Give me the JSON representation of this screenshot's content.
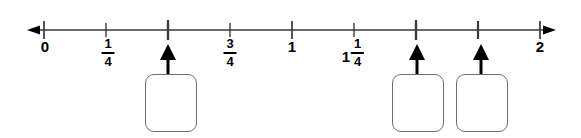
{
  "figure": {
    "kind": "number-line-diagram",
    "title": "",
    "axis": {
      "start_value": 0,
      "end_value": 2,
      "step": 0.25,
      "left_arrowhead": true,
      "right_arrowhead": true,
      "line_color": "#3a3a3a",
      "line_y": 30,
      "x_start_px": 44,
      "x_end_px": 540,
      "arrow_tip_left_px": 27,
      "arrow_tip_right_px": 556
    },
    "ticks": [
      {
        "value": 0,
        "x": 44,
        "major": true,
        "label": "0",
        "label_type": "integer"
      },
      {
        "value": 0.25,
        "x": 106,
        "major": false,
        "label": "1/4",
        "label_type": "fraction",
        "numerator": "1",
        "denominator": "4"
      },
      {
        "value": 0.5,
        "x": 168,
        "major": true,
        "label": "",
        "label_type": "none"
      },
      {
        "value": 0.75,
        "x": 230,
        "major": false,
        "label": "3/4",
        "label_type": "fraction",
        "numerator": "3",
        "denominator": "4"
      },
      {
        "value": 1,
        "x": 292,
        "major": true,
        "label": "1",
        "label_type": "integer"
      },
      {
        "value": 1.25,
        "x": 354,
        "major": false,
        "label": "1 1/4",
        "label_type": "mixed",
        "whole": "1",
        "numerator": "1",
        "denominator": "4"
      },
      {
        "value": 1.5,
        "x": 416,
        "major": true,
        "label": "",
        "label_type": "none"
      },
      {
        "value": 1.75,
        "x": 478,
        "major": false,
        "label": "",
        "label_type": "none"
      },
      {
        "value": 2,
        "x": 540,
        "major": true,
        "label": "2",
        "label_type": "integer"
      }
    ],
    "pointer_arrows": [
      {
        "name": "pointer-arrow-1",
        "target_value": 0.5,
        "x": 168
      },
      {
        "name": "pointer-arrow-2",
        "target_value": 1.5,
        "x": 416
      },
      {
        "name": "pointer-arrow-3",
        "target_value": 1.75,
        "x": 478
      }
    ],
    "answer_boxes": [
      {
        "name": "answer-box-1",
        "value": "",
        "placeholder": "",
        "x": 145,
        "y": 74,
        "width": 52,
        "height": 58
      },
      {
        "name": "answer-box-2",
        "value": "",
        "placeholder": "",
        "x": 392,
        "y": 74,
        "width": 52,
        "height": 58
      },
      {
        "name": "answer-box-3",
        "value": "",
        "placeholder": "",
        "x": 456,
        "y": 74,
        "width": 52,
        "height": 58
      }
    ],
    "colors": {
      "line": "#3a3a3a",
      "tick": "#3a3a3a",
      "arrow": "#000000",
      "box_border": "#6f6f6f",
      "text": "#000000",
      "background": "#ffffff"
    }
  }
}
